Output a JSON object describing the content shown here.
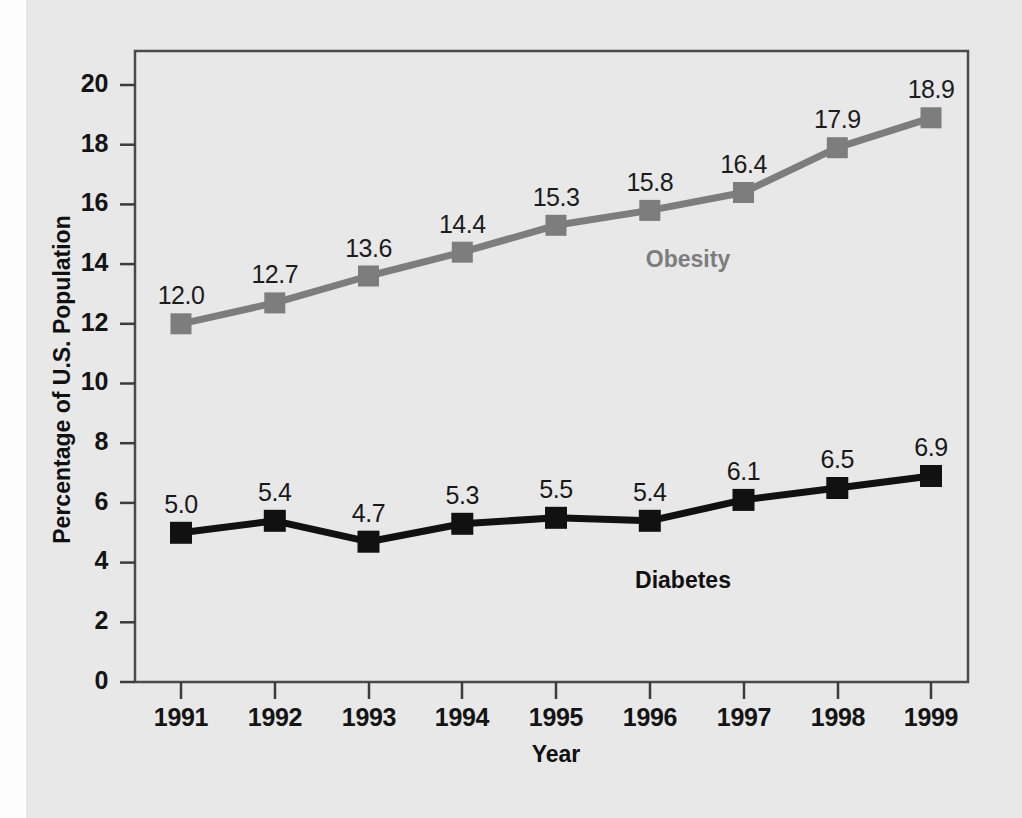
{
  "figure": {
    "background_color": "#e8e8e8",
    "plot_border_color": "#4a4a4a"
  },
  "chart_data": {
    "type": "line",
    "title": "",
    "xlabel": "Year",
    "ylabel": "Percentage of U.S. Population",
    "categories": [
      "1991",
      "1992",
      "1993",
      "1994",
      "1995",
      "1996",
      "1997",
      "1998",
      "1999"
    ],
    "x": [
      1991,
      1992,
      1993,
      1994,
      1995,
      1996,
      1997,
      1998,
      1999
    ],
    "xlim": [
      1990.5,
      1999.5
    ],
    "ylim": [
      0,
      21
    ],
    "yticks": [
      "0",
      "2",
      "4",
      "6",
      "8",
      "10",
      "12",
      "14",
      "16",
      "18",
      "20"
    ],
    "ytick_values": [
      0,
      2,
      4,
      6,
      8,
      10,
      12,
      14,
      16,
      18,
      20
    ],
    "grid": false,
    "legend": "inline-labels",
    "series": [
      {
        "name": "Obesity",
        "color": "#7d7d7d",
        "marker": "square",
        "values": [
          12.0,
          12.7,
          13.6,
          14.4,
          15.3,
          15.8,
          16.4,
          17.9,
          18.9
        ],
        "labels": [
          "12.0",
          "12.7",
          "13.6",
          "14.4",
          "15.3",
          "15.8",
          "16.4",
          "17.9",
          "18.9"
        ],
        "inline_label": "Obesity"
      },
      {
        "name": "Diabetes",
        "color": "#111111",
        "marker": "square",
        "values": [
          5.0,
          5.4,
          4.7,
          5.3,
          5.5,
          5.4,
          6.1,
          6.5,
          6.9
        ],
        "labels": [
          "5.0",
          "5.4",
          "4.7",
          "5.3",
          "5.5",
          "5.4",
          "6.1",
          "6.5",
          "6.9"
        ],
        "inline_label": "Diabetes"
      }
    ]
  }
}
